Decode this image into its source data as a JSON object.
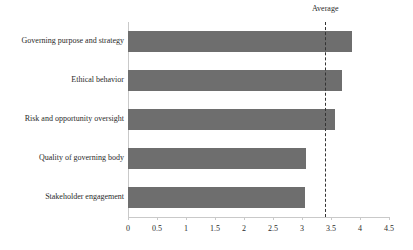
{
  "chart_data": {
    "type": "bar",
    "orientation": "horizontal",
    "title": "",
    "xlabel": "",
    "ylabel": "",
    "categories": [
      "Governing purpose and strategy",
      "Ethical behavior",
      "Risk and opportunity oversight",
      "Quality of governing body",
      "Stakeholder engagement"
    ],
    "values": [
      3.86,
      3.69,
      3.57,
      3.07,
      3.06
    ],
    "xlim": [
      0,
      4.5
    ],
    "xticks": [
      0,
      0.5,
      1,
      1.5,
      2,
      2.5,
      3,
      3.5,
      4,
      4.5
    ],
    "xtick_labels": [
      "0",
      "0.5",
      "1",
      "1.5",
      "2",
      "2.5",
      "3",
      "3.5",
      "4",
      "4.5"
    ],
    "grid": false,
    "legend": false,
    "annotations": [
      {
        "name": "average-reference-line",
        "label": "Average",
        "value": 3.4,
        "style": "dashed-vertical"
      }
    ],
    "series": [
      {
        "name": "Score",
        "values": [
          3.86,
          3.69,
          3.57,
          3.07,
          3.06
        ]
      }
    ],
    "colors": {
      "bar": "#6e6e6e",
      "axis": "#c9c9c9",
      "average_line": "#333333",
      "text": "#2b2b2b",
      "background": "#ffffff"
    }
  }
}
